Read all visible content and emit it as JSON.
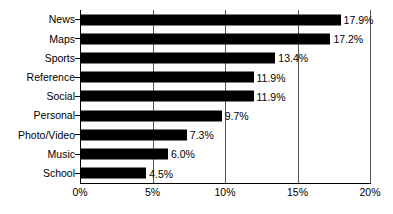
{
  "chart_data": {
    "type": "bar",
    "orientation": "horizontal",
    "title": "",
    "subtitle": "",
    "xlabel": "",
    "ylabel": "",
    "xlim": [
      0,
      20
    ],
    "xticks": [
      "0%",
      "5%",
      "10%",
      "15%",
      "20%"
    ],
    "xtick_values": [
      0,
      5,
      10,
      15,
      20
    ],
    "grid": true,
    "grid_axis": "x",
    "legend": false,
    "legend_position": "none",
    "bar_color": "#000000",
    "axis_color": "#000000",
    "grid_color": "#555555",
    "background": "#ffffff",
    "categories": [
      "News",
      "Maps",
      "Sports",
      "Reference",
      "Social",
      "Personal",
      "Photo/Video",
      "Music",
      "School"
    ],
    "values": [
      17.9,
      17.2,
      13.4,
      11.9,
      11.9,
      9.7,
      7.3,
      6.0,
      4.5
    ],
    "value_labels": [
      "17.9%",
      "17.2%",
      "13.4%",
      "11.9%",
      "11.9%",
      "9.7%",
      "7.3%",
      "6.0%",
      "4.5%"
    ],
    "bars": [
      {
        "category": "News",
        "value": 17.9,
        "label": "17.9%"
      },
      {
        "category": "Maps",
        "value": 17.2,
        "label": "17.2%"
      },
      {
        "category": "Sports",
        "value": 13.4,
        "label": "13.4%"
      },
      {
        "category": "Reference",
        "value": 11.9,
        "label": "11.9%"
      },
      {
        "category": "Social",
        "value": 11.9,
        "label": "11.9%"
      },
      {
        "category": "Personal",
        "value": 9.7,
        "label": "9.7%"
      },
      {
        "category": "Photo/Video",
        "value": 7.3,
        "label": "7.3%"
      },
      {
        "category": "Music",
        "value": 6.0,
        "label": "6.0%"
      },
      {
        "category": "School",
        "value": 4.5,
        "label": "4.5%"
      }
    ]
  }
}
